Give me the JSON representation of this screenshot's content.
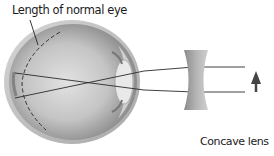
{
  "diagram": {
    "labels": {
      "eye_length": "Length of normal eye",
      "lens": "Concave lens"
    },
    "elements": [
      "eyeball",
      "normal-eye-length-dashed-arc",
      "crossing-light-rays",
      "concave-lens",
      "object-arrow"
    ],
    "colors": {
      "ray": "#2a2a2a",
      "eye_shell": "#9a9a9a",
      "lens": "#9c9c9c",
      "arrow": "#4a4a4a"
    }
  }
}
